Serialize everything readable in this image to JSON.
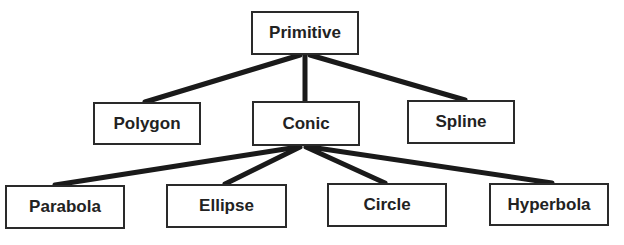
{
  "diagram": {
    "type": "tree",
    "colors": {
      "line": "#1a1a1a",
      "box_border": "#2a2a2a",
      "text": "#222222",
      "background": "#ffffff"
    },
    "nodes": [
      {
        "id": "primitive",
        "label": "Primitive",
        "level": 0
      },
      {
        "id": "polygon",
        "label": "Polygon",
        "level": 1
      },
      {
        "id": "conic",
        "label": "Conic",
        "level": 1
      },
      {
        "id": "spline",
        "label": "Spline",
        "level": 1
      },
      {
        "id": "parabola",
        "label": "Parabola",
        "level": 2
      },
      {
        "id": "ellipse",
        "label": "Ellipse",
        "level": 2
      },
      {
        "id": "circle",
        "label": "Circle",
        "level": 2
      },
      {
        "id": "hyperbola",
        "label": "Hyperbola",
        "level": 2
      }
    ],
    "edges": [
      {
        "from": "primitive",
        "to": "polygon"
      },
      {
        "from": "primitive",
        "to": "conic"
      },
      {
        "from": "primitive",
        "to": "spline"
      },
      {
        "from": "conic",
        "to": "parabola"
      },
      {
        "from": "conic",
        "to": "ellipse"
      },
      {
        "from": "conic",
        "to": "circle"
      },
      {
        "from": "conic",
        "to": "hyperbola"
      }
    ]
  }
}
